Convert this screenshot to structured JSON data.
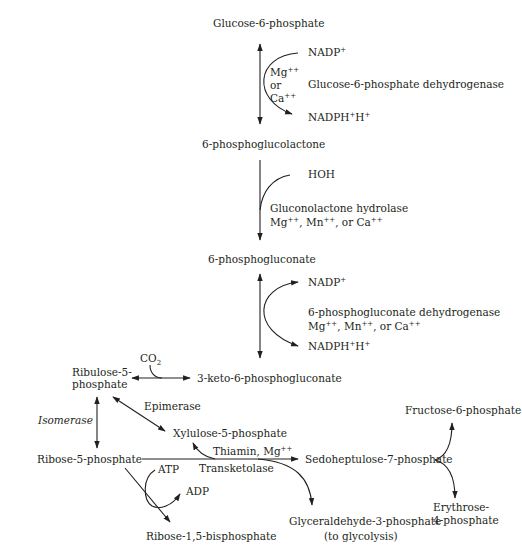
{
  "colors": {
    "ink": "#231f20",
    "background": "#ffffff"
  },
  "nodes": {
    "g6p": "Glucose-6-phosphate",
    "pgl": "6-phosphoglucolactone",
    "pg": "6-phosphogluconate",
    "keto": "3-keto-6-phosphogluconate",
    "ru5p_1": "Ribulose-5-",
    "ru5p_2": "phosphate",
    "r5p": "Ribose-5-phosphate",
    "x5p": "Xylulose-5-phosphate",
    "s7p": "Sedoheptulose-7-phosphate",
    "f6p": "Fructose-6-phosphate",
    "e4p_1": "Erythrose-",
    "e4p_2": "4-phosphate",
    "g3p_1": "Glyceraldehyde-3-phosphate",
    "g3p_2": "(to glycolysis)",
    "rbp": "Ribose-1,5-bisphosphate"
  },
  "step1": {
    "cofactor_in": "NADP",
    "cofactor_in_sup": "+",
    "cofactor_out": "NADPH",
    "cofactor_out_sup1": "+",
    "cofactor_out_h": "H",
    "cofactor_out_sup2": "+",
    "ion1": "Mg",
    "ion1_sup": "++",
    "or": "or",
    "ion2": "Ca",
    "ion2_sup": "++",
    "enzyme": "Glucose-6-phosphate dehydrogenase"
  },
  "step2": {
    "reactant": "HOH",
    "enzyme": "Gluconolactone hydrolase",
    "ions_a": "Mg",
    "ions_b": ", Mn",
    "ions_c": ", or Ca",
    "sup": "++"
  },
  "step3": {
    "cofactor_in": "NADP",
    "cofactor_in_sup": "+",
    "cofactor_out": "NADPH",
    "cofactor_out_sup1": "+",
    "cofactor_out_h": "H",
    "cofactor_out_sup2": "+",
    "enzyme": "6-phosphogluconate dehydrogenase",
    "ions_a": "Mg",
    "ions_b": ", Mn",
    "ions_c": ", or Ca",
    "sup": "++"
  },
  "step4": {
    "co2": "CO",
    "co2_sub": "2"
  },
  "step5": {
    "isomerase": "Isomerase",
    "epimerase": "Epimerase"
  },
  "step6": {
    "cofactor": "Thiamin, Mg",
    "cofactor_sup": "++",
    "enzyme": "Transketolase",
    "atp": "ATP",
    "adp": "ADP"
  }
}
